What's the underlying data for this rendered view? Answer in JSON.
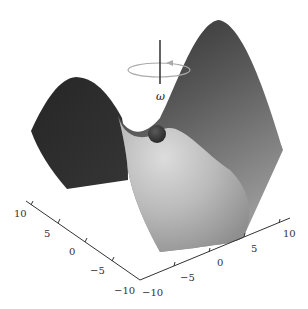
{
  "figure": {
    "kind": "3D saddle surface (potential) with ball at saddle point and rotation indicator",
    "rotation_label": "ω",
    "colors": {
      "background": "#ffffff",
      "surface_dark": "#2a2a2a",
      "surface_mid": "#6e6e6e",
      "surface_light": "#cfcfcf",
      "ball": "#3a3a3a",
      "axis": "#333333",
      "rotation_ring": "#aaaaaa",
      "rotation_axis": "#222222"
    }
  },
  "axes": {
    "left": {
      "ticks": [
        "10",
        "5",
        "0",
        "−5",
        "−10"
      ]
    },
    "right": {
      "ticks": [
        "−10",
        "−5",
        "0",
        "5",
        "10"
      ]
    }
  }
}
